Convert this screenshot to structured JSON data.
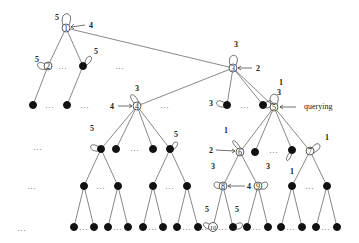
{
  "diagram": {
    "type": "tree",
    "numbered_nodes": [
      {
        "id": "1",
        "label": "1",
        "loop_weight": "5",
        "arrow_weight": "4"
      },
      {
        "id": "2",
        "label": "2",
        "loop_weight": "5"
      },
      {
        "id": "3",
        "label": "3",
        "loop_weight": "3",
        "arrow_weight": "2"
      },
      {
        "id": "4",
        "label": "4",
        "loop_weight": "3",
        "arrow_weight": "4"
      },
      {
        "id": "5",
        "label": "5",
        "loop_weight": "1",
        "annotation": "querying"
      },
      {
        "id": "6",
        "label": "6",
        "loop_weight": "1",
        "arrow_weight": "2"
      },
      {
        "id": "7",
        "label": "7",
        "loop_weight": "1"
      },
      {
        "id": "8",
        "label": "8",
        "loop_weight": "3",
        "arrow_weight": "4"
      },
      {
        "id": "9",
        "label": "9",
        "loop_weight": "3"
      },
      {
        "id": "10",
        "label": "10",
        "loop_weight": "5"
      }
    ],
    "labels": {
      "n1": "1",
      "n2": "2",
      "n3": "3",
      "n4": "4",
      "n5": "5",
      "n6": "6",
      "n7": "7",
      "n8": "8",
      "n9": "9",
      "n10": "10",
      "w1_loop": "5",
      "w1_arrow": "4",
      "w2_loop": "5",
      "wA_loop": "5",
      "w3_loop": "3",
      "w3_arrow": "2",
      "w4_loop": "3",
      "w4_arrow": "4",
      "wB_loop": "3",
      "wC_loop": "3",
      "w5_loop": "1",
      "querying": "querying",
      "wD_loop": "5",
      "wE_loop": "5",
      "w6_loop": "1",
      "w6_arrow": "2",
      "w7_loop": "1",
      "wF_loop": "1",
      "w8_loop": "3",
      "w8_arrow": "4",
      "w9_loop": "3",
      "w10_loop": "5",
      "wG_loop": "5",
      "ellipsis": "..."
    }
  }
}
